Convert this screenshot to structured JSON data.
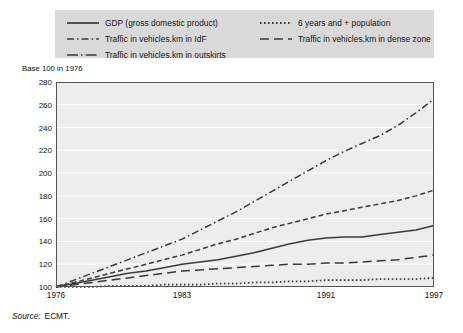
{
  "legend": {
    "items": [
      {
        "id": "gdp",
        "label": "GDP (gross domestic product)",
        "style": "solid",
        "column": "left"
      },
      {
        "id": "idf",
        "label": "Traffic in vehicles.km in IdF",
        "style": "dash-dot",
        "column": "left"
      },
      {
        "id": "outskirts",
        "label": "Traffic in vehicles.km in outskirts",
        "style": "long-dash-dot",
        "column": "left"
      },
      {
        "id": "population",
        "label": "6 years and + population",
        "style": "dotted",
        "column": "right"
      },
      {
        "id": "dense",
        "label": "Traffic in vehicles.km in dense zone",
        "style": "long-dash",
        "column": "right"
      }
    ]
  },
  "axis_caption": "Base 100 in 1976",
  "source": {
    "prefix": "Source:",
    "value": "ECMT."
  },
  "colors": {
    "legend_background": "#d9d9d9",
    "plot_background": "#ededed",
    "gridline": "#ffffff",
    "axis": "#555555",
    "line": "#3a3a3a",
    "text": "#111111"
  },
  "chart_data": {
    "type": "line",
    "title": "",
    "subtitle": "",
    "xlabel": "",
    "ylabel": "Base 100 in 1976",
    "xlim": [
      1976,
      1997
    ],
    "ylim": [
      100,
      280
    ],
    "ytick_values": [
      100,
      120,
      140,
      160,
      180,
      200,
      220,
      240,
      260,
      280
    ],
    "xtick_values": [
      1976,
      1983,
      1991,
      1997
    ],
    "xtick_labels": [
      "1976",
      "1983",
      "1991",
      "1997"
    ],
    "grid": "horizontal",
    "legend_position": "top",
    "x": [
      1976,
      1977,
      1978,
      1979,
      1980,
      1981,
      1982,
      1983,
      1984,
      1985,
      1986,
      1987,
      1988,
      1989,
      1990,
      1991,
      1992,
      1993,
      1994,
      1995,
      1996,
      1997
    ],
    "series": [
      {
        "name": "GDP (gross domestic product)",
        "style": "solid",
        "values": [
          100,
          103,
          106,
          109,
          112,
          114,
          117,
          120,
          122,
          124,
          127,
          130,
          134,
          138,
          141,
          143,
          144,
          144,
          146,
          148,
          150,
          154
        ]
      },
      {
        "name": "6 years and + population",
        "style": "dotted",
        "values": [
          100,
          100,
          100,
          101,
          101,
          101,
          102,
          102,
          102,
          103,
          103,
          104,
          104,
          105,
          105,
          106,
          106,
          106,
          107,
          107,
          107,
          108
        ]
      },
      {
        "name": "Traffic in vehicles.km in IdF",
        "style": "dash-dot",
        "values": [
          100,
          106,
          112,
          118,
          124,
          130,
          136,
          142,
          150,
          158,
          166,
          175,
          184,
          193,
          202,
          211,
          219,
          226,
          233,
          242,
          253,
          265
        ]
      },
      {
        "name": "Traffic in vehicles.km in dense zone",
        "style": "long-dash",
        "values": [
          100,
          102,
          104,
          106,
          108,
          110,
          112,
          114,
          115,
          116,
          117,
          118,
          119,
          120,
          120,
          121,
          121,
          122,
          123,
          124,
          126,
          128
        ]
      },
      {
        "name": "Traffic in vehicles.km in outskirts",
        "style": "dashed",
        "values": [
          100,
          104,
          108,
          112,
          116,
          120,
          124,
          128,
          133,
          138,
          142,
          147,
          152,
          156,
          160,
          164,
          167,
          170,
          173,
          176,
          180,
          185
        ]
      }
    ]
  }
}
